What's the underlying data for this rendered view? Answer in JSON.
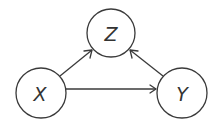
{
  "diagram": {
    "type": "directed-acyclic-graph",
    "nodes": [
      {
        "id": "Z",
        "label": "Z",
        "cx": 111,
        "cy": 33,
        "r": 24
      },
      {
        "id": "X",
        "label": "X",
        "cx": 41,
        "cy": 93,
        "r": 25
      },
      {
        "id": "Y",
        "label": "Y",
        "cx": 182,
        "cy": 93,
        "r": 25
      }
    ],
    "edges": [
      {
        "from": "X",
        "to": "Z"
      },
      {
        "from": "Y",
        "to": "Z"
      },
      {
        "from": "X",
        "to": "Y"
      }
    ],
    "colors": {
      "stroke": "#3a3a3a",
      "label": "#333333",
      "background": "#ffffff"
    }
  }
}
